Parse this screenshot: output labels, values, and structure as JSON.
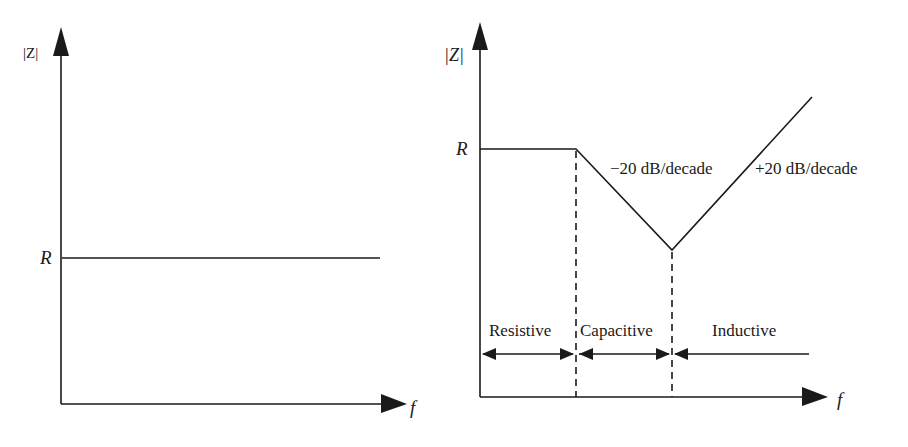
{
  "figure": {
    "left_panel": {
      "y_axis_label": "|Z|",
      "x_axis_label": "f",
      "level_label": "R",
      "description": "Ideal resistor impedance: constant |Z| = R across frequency"
    },
    "right_panel": {
      "y_axis_label": "|Z|",
      "x_axis_label": "f",
      "level_label": "R",
      "slope_down_label": "−20 dB/decade",
      "slope_up_label": "+20 dB/decade",
      "regions": [
        {
          "label": "Resistive"
        },
        {
          "label": "Capacitive"
        },
        {
          "label": "Inductive"
        }
      ]
    },
    "colors": {
      "line": "#1a1a1a",
      "background": "#ffffff"
    }
  }
}
